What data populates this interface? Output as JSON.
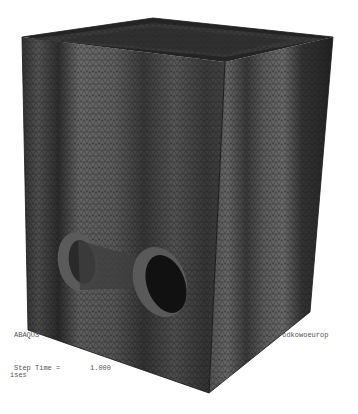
{
  "viewport": {
    "description": "FEA mesh render of an open-top rectangular box with two circular pipe openings",
    "colors": {
      "background": "#ffffff",
      "mesh_light": "#6a6a6a",
      "mesh_mid": "#4a4a4a",
      "mesh_dark": "#262626",
      "rim": "#1e1e1e",
      "hole_interior": "#111111"
    }
  },
  "annotations": {
    "header_prefix": "ABAQUS",
    "header_suffix": "rodkowoeurop",
    "step_time_label": "Step Time =",
    "step_time_value": "1.000",
    "variable_label": "ises"
  }
}
